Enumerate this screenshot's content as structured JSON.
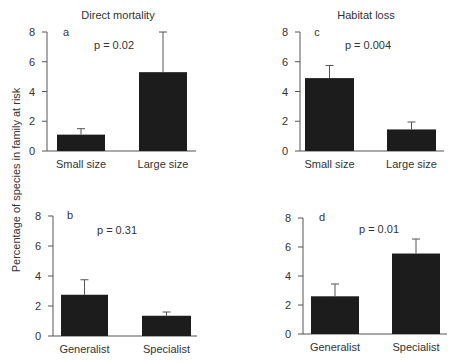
{
  "figure": {
    "ylabel": "Percentage of species in family at risk"
  },
  "chart_data": [
    {
      "type": "bar",
      "panel": "a",
      "title": "Direct mortality",
      "annotation": "p = 0.02",
      "categories": [
        "Small size",
        "Large size"
      ],
      "values": [
        1.1,
        5.3
      ],
      "error_upper": [
        1.5,
        8.0
      ],
      "ylim": [
        0,
        8
      ],
      "yticks": [
        "0",
        "2",
        "4",
        "6",
        "8"
      ],
      "xlabel": "",
      "ylabel": "Percentage of species in family at risk",
      "grid": false
    },
    {
      "type": "bar",
      "panel": "c",
      "title": "Habitat loss",
      "annotation": "p = 0.004",
      "categories": [
        "Small size",
        "Large size"
      ],
      "values": [
        4.9,
        1.45
      ],
      "error_upper": [
        5.75,
        1.95
      ],
      "ylim": [
        0,
        8
      ],
      "yticks": [
        "0",
        "2",
        "4",
        "6",
        "8"
      ],
      "xlabel": "",
      "ylabel": "",
      "grid": false
    },
    {
      "type": "bar",
      "panel": "b",
      "title": "",
      "annotation": "p = 0.31",
      "categories": [
        "Generalist",
        "Specialist"
      ],
      "values": [
        2.75,
        1.35
      ],
      "error_upper": [
        3.75,
        1.6
      ],
      "ylim": [
        0,
        8
      ],
      "yticks": [
        "0",
        "2",
        "4",
        "6",
        "8"
      ],
      "xlabel": "",
      "ylabel": "",
      "grid": false
    },
    {
      "type": "bar",
      "panel": "d",
      "title": "",
      "annotation": "p = 0.01",
      "categories": [
        "Generalist",
        "Specialist"
      ],
      "values": [
        2.6,
        5.55
      ],
      "error_upper": [
        3.45,
        6.55
      ],
      "ylim": [
        0,
        8
      ],
      "yticks": [
        "0",
        "2",
        "4",
        "6",
        "8"
      ],
      "xlabel": "",
      "ylabel": "",
      "grid": false
    }
  ]
}
